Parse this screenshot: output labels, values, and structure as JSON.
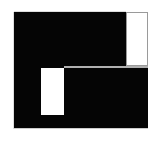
{
  "image": {
    "width": 155,
    "height": 145,
    "background_color": "#ffffff",
    "description": "Abstract black rectangular glyph with two white rectangular cutouts"
  },
  "shape": {
    "name": "black-block-glyph",
    "fill_color": "#050505",
    "bounds": {
      "x": 14,
      "y": 12,
      "width": 134,
      "height": 116
    }
  },
  "cutouts": [
    {
      "name": "top-right-box",
      "fill_color": "#ffffff",
      "border_color": "#9a9a9a",
      "bounds": {
        "x": 126,
        "y": 12,
        "width": 22,
        "height": 54
      }
    },
    {
      "name": "lower-left-notch",
      "fill_color": "#ffffff",
      "border_color": "none",
      "bounds": {
        "x": 41,
        "y": 68,
        "width": 23,
        "height": 47
      }
    }
  ],
  "details": {
    "seam_color": "#cfcfcf",
    "shadow_color": "#b8b8b8",
    "seam_bounds": {
      "x": 64,
      "y": 66,
      "width": 84,
      "height": 2
    }
  }
}
